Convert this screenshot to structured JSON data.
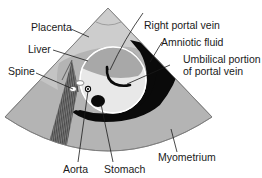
{
  "figure": {
    "type": "ultrasound-sector-diagram",
    "colors": {
      "background": "#ffffff",
      "placenta": "#c8c8c8",
      "myometrium": "#b4b4b4",
      "liver": "#a8a8a8",
      "abdomen": "#e6e6e6",
      "amniotic_fluid": "#0a0a0a",
      "shadow_stripes": "#5a5a5a",
      "outline": "#6e6e6e"
    }
  },
  "labels": {
    "placenta": "Placenta",
    "liver": "Liver",
    "spine": "Spine",
    "right_portal_vein": "Right portal vein",
    "amniotic_fluid": "Amniotic fluid",
    "umbilical_line1": "Umbilical portion",
    "umbilical_line2": "of portal vein",
    "aorta": "Aorta",
    "stomach": "Stomach",
    "myometrium": "Myometrium"
  }
}
